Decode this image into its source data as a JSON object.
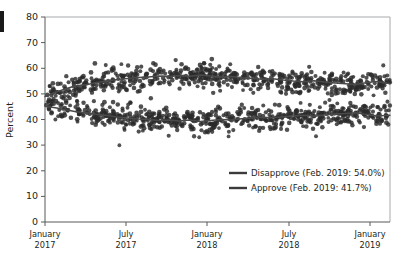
{
  "figure": {
    "edge_marker_name": "page-edge-bar"
  },
  "chart_data": {
    "type": "scatter",
    "title": "",
    "xlabel": "",
    "ylabel": "Percent",
    "ylim": [
      0,
      80
    ],
    "yticks": [
      0,
      10,
      20,
      30,
      40,
      50,
      60,
      70,
      80
    ],
    "ytick_labels": [
      "0",
      "10",
      "20",
      "30",
      "40",
      "50",
      "60",
      "70",
      "80"
    ],
    "xlim": [
      "2017-01",
      "2019-02"
    ],
    "xticks": [
      "2017-01",
      "2017-07",
      "2018-01",
      "2018-07",
      "2019-01"
    ],
    "xtick_labels": [
      {
        "line1": "January",
        "line2": "2017"
      },
      {
        "line1": "July",
        "line2": "2017"
      },
      {
        "line1": "January",
        "line2": "2018"
      },
      {
        "line1": "July",
        "line2": "2018"
      },
      {
        "line1": "January",
        "line2": "2019"
      }
    ],
    "grid": false,
    "legend_position": "lower-right-inside",
    "legend": [
      {
        "label": "Disapprove (Feb. 2019: 54.0%)",
        "color": "#3b3b3b"
      },
      {
        "label": "Approve (Feb. 2019: 41.7%)",
        "color": "#3b3b3b"
      }
    ],
    "series": [
      {
        "name": "Disapprove",
        "kind": "trend-line",
        "final_value": 54.0,
        "x": [
          0,
          0.03,
          0.06,
          0.09,
          0.12,
          0.15,
          0.18,
          0.21,
          0.24,
          0.27,
          0.3,
          0.33,
          0.36,
          0.39,
          0.42,
          0.45,
          0.48,
          0.51,
          0.54,
          0.57,
          0.6,
          0.63,
          0.66,
          0.69,
          0.72,
          0.75,
          0.78,
          0.81,
          0.84,
          0.87,
          0.9,
          0.93,
          0.96,
          1.0
        ],
        "values": [
          49.0,
          50.6,
          52.0,
          53.2,
          53.6,
          54.4,
          55.0,
          55.6,
          56.0,
          56.4,
          56.6,
          57.0,
          56.8,
          57.2,
          56.9,
          57.4,
          57.0,
          56.6,
          56.8,
          56.3,
          56.0,
          55.7,
          55.9,
          55.4,
          55.0,
          54.7,
          55.1,
          54.6,
          54.2,
          54.0,
          53.7,
          54.3,
          54.8,
          54.0
        ]
      },
      {
        "name": "Approve",
        "kind": "trend-line",
        "final_value": 41.7,
        "x": [
          0,
          0.03,
          0.06,
          0.09,
          0.12,
          0.15,
          0.18,
          0.21,
          0.24,
          0.27,
          0.3,
          0.33,
          0.36,
          0.39,
          0.42,
          0.45,
          0.48,
          0.51,
          0.54,
          0.57,
          0.6,
          0.63,
          0.66,
          0.69,
          0.72,
          0.75,
          0.78,
          0.81,
          0.84,
          0.87,
          0.9,
          0.93,
          0.96,
          1.0
        ],
        "values": [
          45.2,
          44.6,
          43.8,
          43.0,
          42.6,
          42.0,
          41.6,
          41.0,
          40.6,
          40.2,
          40.0,
          39.6,
          39.8,
          39.4,
          39.8,
          39.2,
          39.6,
          40.0,
          39.8,
          40.3,
          40.6,
          40.9,
          40.7,
          41.1,
          41.4,
          41.7,
          41.3,
          41.8,
          42.1,
          42.3,
          42.6,
          42.0,
          41.4,
          41.7
        ]
      },
      {
        "name": "Disapprove polls",
        "kind": "scatter",
        "center_series": "Disapprove",
        "spread": 4.6,
        "outlier_high": 76.0,
        "outlier_low": 44.0,
        "n_points": 620
      },
      {
        "name": "Approve polls",
        "kind": "scatter",
        "center_series": "Approve",
        "spread": 4.4,
        "outlier_high": 60.0,
        "outlier_low": 24.0,
        "n_points": 620
      }
    ]
  }
}
